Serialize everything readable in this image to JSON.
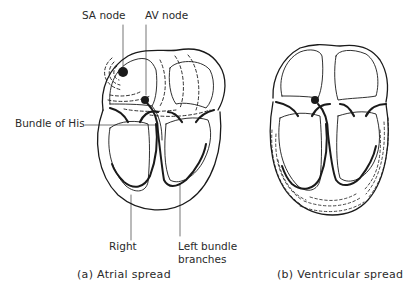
{
  "figure": {
    "panels": [
      {
        "id": "a",
        "caption": "(a)  Atrial  spread",
        "labels": {
          "sa_node": "SA node",
          "av_node": "AV node",
          "bundle_of_his": "Bundle of His",
          "right": "Right",
          "left_bundle_line1": "Left bundle",
          "left_bundle_line2": "branches"
        }
      },
      {
        "id": "b",
        "caption": "(b)  Ventricular spread"
      }
    ],
    "colors": {
      "ink": "#1a1a1a",
      "background": "#ffffff"
    }
  }
}
